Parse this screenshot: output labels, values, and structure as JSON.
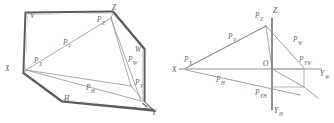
{
  "figure": {
    "panels": [
      {
        "id": "left-panel",
        "name": "oblique-solid-panel",
        "description": "Closed hexagonal band outline with interior triangular trace lines",
        "vertex_labels": [
          {
            "key": "V",
            "text": "V",
            "sub": "",
            "x": 30,
            "y": 18
          },
          {
            "key": "Z",
            "text": "Z",
            "sub": "",
            "x": 112,
            "y": 10
          },
          {
            "key": "W",
            "text": "W",
            "sub": "",
            "x": 135,
            "y": 52
          },
          {
            "key": "X",
            "text": "X",
            "sub": "",
            "x": 5,
            "y": 71
          },
          {
            "key": "H",
            "text": "H",
            "sub": "",
            "x": 64,
            "y": 101
          },
          {
            "key": "Y",
            "text": "Y",
            "sub": "",
            "x": 152,
            "y": 115
          }
        ],
        "trace_labels": [
          {
            "key": "PZ",
            "text": "P",
            "sub": "Z",
            "x": 97,
            "y": 22
          },
          {
            "key": "PV",
            "text": "P",
            "sub": "V",
            "x": 63,
            "y": 45
          },
          {
            "key": "PX",
            "text": "P",
            "sub": "X",
            "x": 34,
            "y": 63
          },
          {
            "key": "PW",
            "text": "P",
            "sub": "W",
            "x": 128,
            "y": 62
          },
          {
            "key": "PH",
            "text": "P",
            "sub": "H",
            "x": 86,
            "y": 90
          },
          {
            "key": "PY",
            "text": "P",
            "sub": "Y",
            "x": 135,
            "y": 85
          }
        ]
      },
      {
        "id": "right-panel",
        "name": "axis-trace-panel",
        "description": "Orthogonal axis cross with triangular trace plane and projection rectangle",
        "vertex_labels": [
          {
            "key": "Z",
            "text": "Z",
            "sub": "",
            "x": 273,
            "y": 13
          },
          {
            "key": "X",
            "text": "X",
            "sub": "",
            "x": 172,
            "y": 69
          },
          {
            "key": "O",
            "text": "O",
            "sub": "",
            "x": 263,
            "y": 62
          },
          {
            "key": "YW",
            "text": "Y",
            "sub": "W",
            "x": 322,
            "y": 74
          },
          {
            "key": "YH",
            "text": "Y",
            "sub": "H",
            "x": 272,
            "y": 113
          }
        ],
        "trace_labels": [
          {
            "key": "PZ",
            "text": "P",
            "sub": "Z",
            "x": 258,
            "y": 17
          },
          {
            "key": "PV",
            "text": "P",
            "sub": "V",
            "x": 230,
            "y": 38
          },
          {
            "key": "PW",
            "text": "P",
            "sub": "W",
            "x": 295,
            "y": 41
          },
          {
            "key": "PX",
            "text": "P",
            "sub": "X",
            "x": 186,
            "y": 61
          },
          {
            "key": "PYW",
            "text": "P",
            "sub": "YW",
            "x": 300,
            "y": 61
          },
          {
            "key": "PH",
            "text": "P",
            "sub": "H",
            "x": 218,
            "y": 81
          },
          {
            "key": "PYH",
            "text": "P",
            "sub": "YH",
            "x": 258,
            "y": 94
          }
        ]
      }
    ],
    "colors": {
      "background": "#ffffff",
      "band_stroke": "#5d5d5d",
      "thin_stroke": "#8a8a8a",
      "label_fill": "#6e6e6e",
      "axis_stroke": "#7e7e7e"
    }
  }
}
